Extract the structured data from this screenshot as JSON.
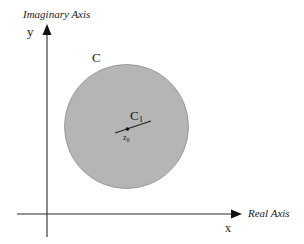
{
  "diagram": {
    "type": "complex-plane-contour",
    "axes": {
      "vertical_label": "Imaginary Axis",
      "vertical_var": "y",
      "horizontal_label": "Real Axis",
      "horizontal_var": "x"
    },
    "regions": {
      "outer_contour_label": "C",
      "inner_contour_label_main": "C",
      "inner_contour_label_sub": "1",
      "point_label_main": "z",
      "point_label_sub": "0"
    },
    "colors": {
      "disk_fill": "#b5b5b5",
      "disk_stroke": "#8a8a8a",
      "axis": "#2a2a2a",
      "text": "#1a1a1a"
    }
  }
}
